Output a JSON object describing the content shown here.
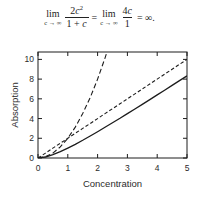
{
  "formula": {
    "lim": "lim",
    "sub": "c → ∞",
    "frac1": {
      "coeff": "2",
      "var": "c",
      "exp": "2",
      "den_pre": "1 + ",
      "den_var": "c"
    },
    "eq": "=",
    "frac2": {
      "coeff": "4",
      "var": "c",
      "den": "1"
    },
    "result": "= ∞."
  },
  "chart_data": {
    "type": "line",
    "title": "",
    "xlabel": "Concentration",
    "ylabel": "Absorption",
    "xlim": [
      0,
      5
    ],
    "ylim": [
      0,
      10.75
    ],
    "xticks": [
      0,
      1,
      2,
      3,
      4,
      5
    ],
    "yticks": [
      0,
      2,
      4,
      6,
      8,
      10
    ],
    "grid": false,
    "legend": "none",
    "x": [
      0,
      0.25,
      0.5,
      0.75,
      1,
      1.25,
      1.5,
      1.75,
      2,
      2.25,
      2.5,
      2.75,
      3,
      3.25,
      3.5,
      3.75,
      4,
      4.25,
      4.5,
      4.75,
      5
    ],
    "series": [
      {
        "name": "2c²/(1+c)",
        "style": "solid",
        "values": [
          0,
          0.1,
          0.33,
          0.64,
          1,
          1.39,
          1.8,
          2.23,
          2.67,
          3.12,
          3.57,
          4.03,
          4.5,
          4.97,
          5.44,
          5.92,
          6.4,
          6.88,
          7.36,
          7.85,
          8.33
        ]
      },
      {
        "name": "2c",
        "style": "dash-short",
        "values": [
          0,
          0.5,
          1,
          1.5,
          2,
          2.5,
          3,
          3.5,
          4,
          4.5,
          5,
          5.5,
          6,
          6.5,
          7,
          7.5,
          8,
          8.5,
          9,
          9.5,
          10
        ]
      },
      {
        "name": "2c²",
        "style": "dash-long",
        "values": [
          0,
          0.13,
          0.5,
          1.13,
          2,
          3.13,
          4.5,
          6.13,
          8,
          10.13,
          12.5,
          15.13,
          18,
          21.13,
          24.5,
          28.13,
          32,
          36.13,
          40.5,
          45.13,
          50
        ]
      }
    ]
  },
  "colors": {
    "line": "#1c1c1c",
    "text": "#2b2b2b",
    "background": "#ffffff"
  }
}
